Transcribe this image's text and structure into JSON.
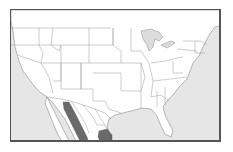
{
  "map": {
    "title": "Species range map",
    "region": "United States and northern Mexico",
    "colors": {
      "ocean": "#e6e6e6",
      "land": "#ffffff",
      "borders": "#8a8a8a",
      "range_fill": "#5a5a5a",
      "frame": "#555555"
    },
    "range_areas": [
      {
        "name": "Sierra Madre Occidental band",
        "shade": "dark gray"
      },
      {
        "name": "Northeastern Mexico patch",
        "shade": "dark gray"
      }
    ]
  }
}
